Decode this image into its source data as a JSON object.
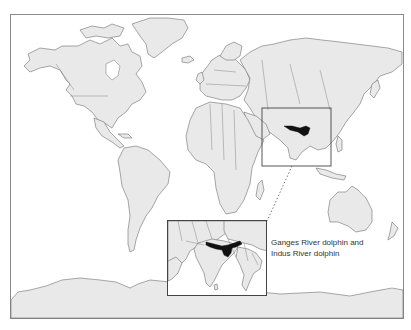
{
  "map": {
    "type": "world-outline",
    "land_color": "#e9e9e9",
    "outline_color": "#6f6f6f",
    "range_color": "#111111",
    "highlight_region": "South Asia (Indus and Ganges river basins)"
  },
  "inset": {
    "region": "Indian subcontinent",
    "caption_line1": "Ganges River dolphin and",
    "caption_line2": "Indus River dolphin"
  }
}
